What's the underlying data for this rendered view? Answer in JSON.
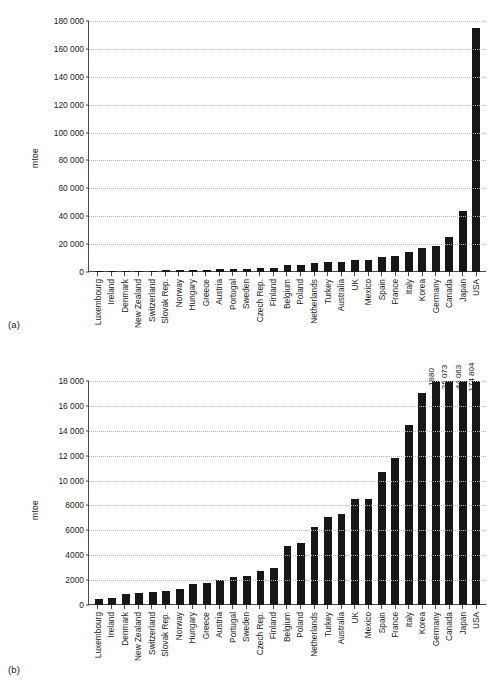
{
  "figure": {
    "panel_a_label": "(a)",
    "panel_b_label": "(b)"
  },
  "chart_data": [
    {
      "id": "a",
      "type": "bar",
      "title": "",
      "subtitle": "",
      "xlabel": "",
      "ylabel": "mtoe",
      "ylim": [
        0,
        180000
      ],
      "ytick_values": [
        0,
        20000,
        40000,
        60000,
        80000,
        100000,
        120000,
        140000,
        160000,
        180000
      ],
      "ytick_labels": [
        "0",
        "20 000",
        "40 000",
        "60 000",
        "80 000",
        "100 000",
        "120 000",
        "140 000",
        "160 000",
        "180 000"
      ],
      "grid": true,
      "legend": "none",
      "bar_color": "#171717",
      "categories": [
        "Luxembourg",
        "Ireland",
        "Denmark",
        "New Zealand",
        "Switzerland",
        "Slovak Rep.",
        "Norway",
        "Hungary",
        "Greece",
        "Austria",
        "Portugal",
        "Sweden",
        "Czech Rep.",
        "Finland",
        "Belgium",
        "Poland",
        "Netherlands",
        "Turkey",
        "Australia",
        "UK",
        "Mexico",
        "Spain",
        "France",
        "Italy",
        "Korea",
        "Germany",
        "Canada",
        "Japan",
        "USA"
      ],
      "values": [
        500,
        600,
        850,
        950,
        1050,
        1100,
        1270,
        1700,
        1750,
        2000,
        2250,
        2300,
        2700,
        3000,
        4750,
        4980,
        6300,
        7050,
        7300,
        8500,
        8520,
        10700,
        11800,
        14500,
        17000,
        18980,
        25073,
        44063,
        174804
      ],
      "data_labels": []
    },
    {
      "id": "b",
      "type": "bar",
      "title": "",
      "subtitle": "",
      "xlabel": "",
      "ylabel": "mtoe",
      "ylim": [
        0,
        18000
      ],
      "ytick_values": [
        0,
        2000,
        4000,
        6000,
        8000,
        10000,
        12000,
        14000,
        16000,
        18000
      ],
      "ytick_labels": [
        "0",
        "2000",
        "4000",
        "6000",
        "8000",
        "10 000",
        "12 000",
        "14 000",
        "16 000",
        "18 000"
      ],
      "grid": true,
      "legend": "none",
      "bar_color": "#171717",
      "note": "last four bars exceed the axis maximum and are clipped; their true values are printed above the bars",
      "categories": [
        "Luxembourg",
        "Ireland",
        "Denmark",
        "New Zealand",
        "Switzerland",
        "Slovak Rep.",
        "Norway",
        "Hungary",
        "Greece",
        "Austria",
        "Portugal",
        "Sweden",
        "Czech Rep.",
        "Finland",
        "Belgium",
        "Poland",
        "Netherlands",
        "Turkey",
        "Australia",
        "UK",
        "Mexico",
        "Spain",
        "France",
        "Italy",
        "Korea",
        "Germany",
        "Canada",
        "Japan",
        "USA"
      ],
      "values": [
        500,
        600,
        850,
        950,
        1050,
        1100,
        1270,
        1700,
        1750,
        2000,
        2250,
        2300,
        2700,
        3000,
        4750,
        4980,
        6300,
        7050,
        7300,
        8500,
        8520,
        10700,
        11800,
        14500,
        17000,
        18980,
        25073,
        44063,
        174804
      ],
      "data_labels": [
        "",
        "",
        "",
        "",
        "",
        "",
        "",
        "",
        "",
        "",
        "",
        "",
        "",
        "",
        "",
        "",
        "",
        "",
        "",
        "",
        "",
        "",
        "",
        "",
        "",
        "1980",
        "25 073",
        "44 063",
        "174 804"
      ]
    }
  ]
}
